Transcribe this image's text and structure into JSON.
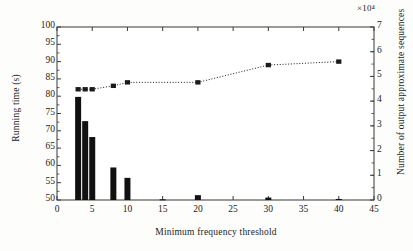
{
  "chart_data": {
    "type": "bar",
    "title": "",
    "xlabel": "Minimum frequency threshold",
    "ylabel": "Running time (s)",
    "y2label": "Number of output approximate sequences",
    "y2_multiplier": "×10⁴",
    "xlim": [
      0,
      45
    ],
    "ylim": [
      50,
      100
    ],
    "y2lim": [
      0,
      7
    ],
    "xticks": [
      0,
      5,
      10,
      15,
      20,
      25,
      30,
      35,
      40,
      45
    ],
    "yticks": [
      50,
      55,
      60,
      65,
      70,
      75,
      80,
      85,
      90,
      95,
      100
    ],
    "y2ticks": [
      0,
      1,
      2,
      3,
      4,
      5,
      6,
      7
    ],
    "grid": false,
    "legend": "none",
    "series": [
      {
        "name": "Running time (s)",
        "type": "bar",
        "axis": "left",
        "color": "#111111",
        "x": [
          3,
          4,
          5,
          8,
          10,
          15,
          20,
          30,
          40
        ],
        "values": [
          79.8,
          72.8,
          68.2,
          59.4,
          56.4,
          50.2,
          51.4,
          50.7,
          50.3
        ]
      },
      {
        "name": "Number of output approximate sequences",
        "type": "line",
        "axis": "right",
        "color": "#1a1a1a",
        "linestyle": "dotted",
        "marker": "square",
        "x": [
          3,
          4,
          5,
          8,
          10,
          20,
          30,
          40
        ],
        "values": [
          4.48,
          4.48,
          4.48,
          4.62,
          4.76,
          4.76,
          5.46,
          5.6
        ],
        "values_on_left_scale": [
          82.0,
          82.0,
          82.0,
          83.0,
          84.0,
          84.0,
          89.0,
          90.0
        ]
      }
    ]
  },
  "ticklabels": {
    "x": [
      "0",
      "5",
      "10",
      "15",
      "20",
      "25",
      "30",
      "35",
      "40",
      "45"
    ],
    "y_left": [
      "100",
      "95",
      "90",
      "85",
      "80",
      "75",
      "70",
      "65",
      "60",
      "55",
      "50"
    ],
    "y_right": [
      "7",
      "6",
      "5",
      "4",
      "3",
      "2",
      "1",
      "0"
    ]
  },
  "labels": {
    "x_axis_title": "Minimum frequency threshold",
    "y_left_axis_title": "Running time (s)",
    "y_right_axis_title": "Number of output approximate sequences",
    "right_multiplier": "×10⁴"
  },
  "colors": {
    "bar": "#111111",
    "line": "#1a1a1a",
    "axis": "#3a3a3a",
    "background": "#fdfdfb"
  }
}
